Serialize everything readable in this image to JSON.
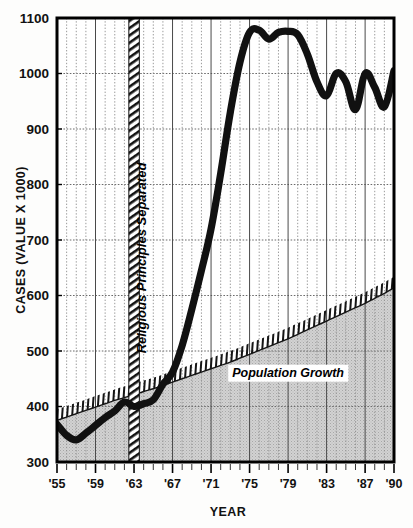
{
  "chart_data": {
    "type": "line",
    "title": "",
    "subtitle": "",
    "xlabel": "YEAR",
    "ylabel": "CASES (VALUE X 1000)",
    "xlim": [
      1955,
      1990
    ],
    "ylim": [
      300,
      1100
    ],
    "ytick_labels": [
      "1100",
      "1000",
      "900",
      "800",
      "700",
      "600",
      "500",
      "400",
      "300"
    ],
    "ytick_values": [
      1100,
      1000,
      900,
      800,
      700,
      600,
      500,
      400,
      300
    ],
    "xtick_labels": [
      "'55",
      "'59",
      "'63",
      "'67",
      "'71",
      "'75",
      "'79",
      "'83",
      "'87",
      "'90"
    ],
    "xtick_values": [
      1955,
      1959,
      1963,
      1967,
      1971,
      1975,
      1979,
      1983,
      1987,
      1990
    ],
    "grid": true,
    "legend_position": "inline-annotation",
    "x": [
      1955,
      1956,
      1957,
      1958,
      1959,
      1960,
      1961,
      1962,
      1963,
      1964,
      1965,
      1966,
      1967,
      1968,
      1969,
      1970,
      1971,
      1972,
      1973,
      1974,
      1975,
      1976,
      1977,
      1978,
      1979,
      1980,
      1981,
      1982,
      1983,
      1984,
      1985,
      1986,
      1987,
      1988,
      1989,
      1990
    ],
    "series": [
      {
        "name": "Cases",
        "style": "thick-black-line",
        "values": [
          368,
          348,
          340,
          352,
          366,
          380,
          392,
          408,
          400,
          405,
          412,
          440,
          462,
          510,
          575,
          645,
          720,
          820,
          930,
          1020,
          1074,
          1078,
          1062,
          1074,
          1076,
          1070,
          1035,
          985,
          960,
          1000,
          985,
          935,
          1000,
          975,
          940,
          1005
        ]
      },
      {
        "name": "Population Growth",
        "style": "hatched-boundary-shaded-area",
        "values": [
          375,
          381,
          387,
          393,
          399,
          405,
          411,
          416,
          421,
          427,
          432,
          438,
          444,
          450,
          456,
          462,
          468,
          474,
          480,
          487,
          494,
          501,
          508,
          515,
          522,
          530,
          538,
          546,
          554,
          562,
          570,
          578,
          586,
          595,
          604,
          614
        ]
      }
    ],
    "annotations": [
      {
        "name": "population-growth-label",
        "text": "Population Growth",
        "x": 1979,
        "y": 460,
        "style": "bold-italic-boxed"
      },
      {
        "name": "religious-principles-marker",
        "text": "Religious Principles Separated",
        "x": 1963,
        "style": "vertical-hatched-bar",
        "orientation": "rotated-90"
      }
    ]
  },
  "axes": {
    "y_title": "CASES (VALUE X 1000)",
    "x_title": "YEAR"
  },
  "colors": {
    "line": "#111111",
    "area_fill": "#c9c9c9",
    "grid": "#6b6b6b",
    "axis": "#000000",
    "background": "#ffffff",
    "label_box": "#ffffff"
  }
}
